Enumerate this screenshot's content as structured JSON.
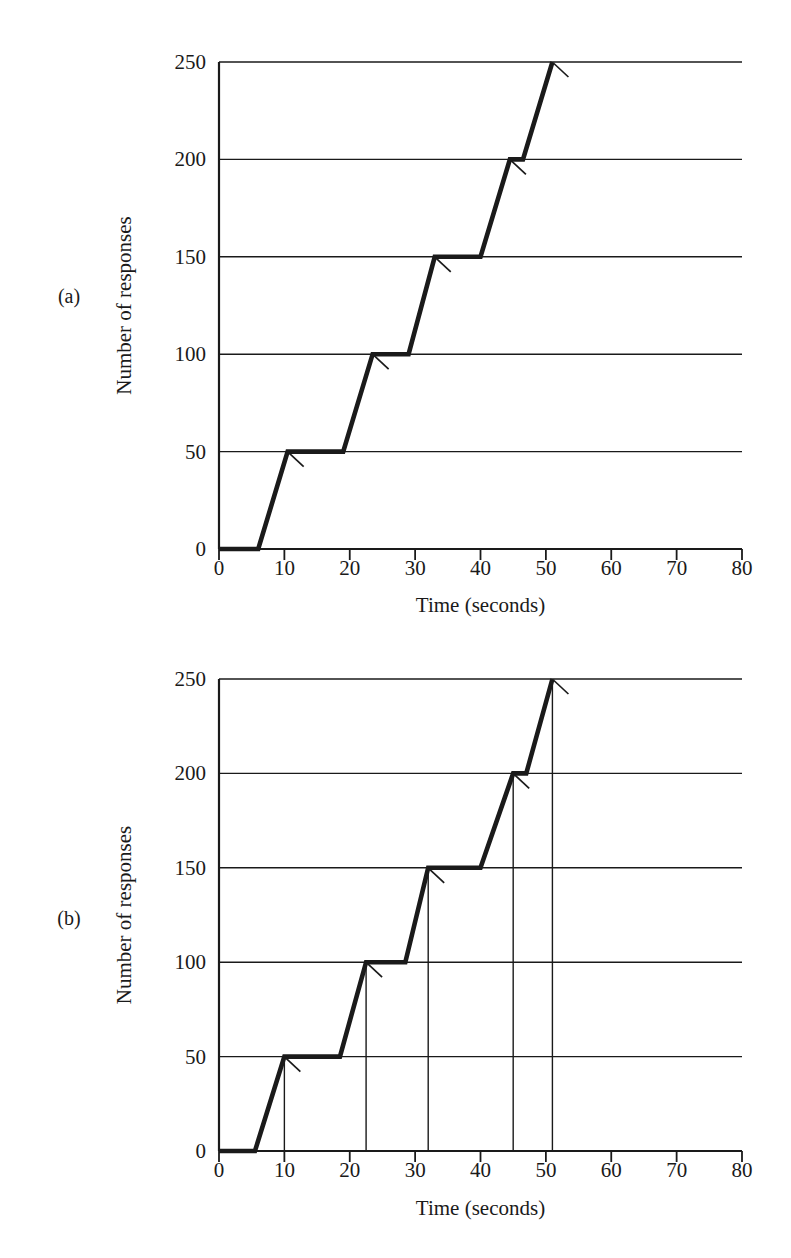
{
  "figure": {
    "background": "#ffffff",
    "ink": "#1a1a1a",
    "panels": [
      {
        "id": "a",
        "label": "(a)"
      },
      {
        "id": "b",
        "label": "(b)"
      }
    ]
  },
  "chart_data": [
    {
      "type": "line",
      "panel": "(a)",
      "title": "",
      "xlabel": "Time (seconds)",
      "ylabel": "Number of responses",
      "xlim": [
        0,
        80
      ],
      "ylim": [
        0,
        250
      ],
      "xticks": [
        0,
        10,
        20,
        30,
        40,
        50,
        60,
        70,
        80
      ],
      "xtick_labels": [
        "0",
        "10",
        "20",
        "30",
        "40",
        "50",
        "60",
        "70",
        "80"
      ],
      "yticks": [
        0,
        50,
        100,
        150,
        200,
        250
      ],
      "ytick_labels": [
        "0",
        "50",
        "100",
        "150",
        "200",
        "250"
      ],
      "grid": "horizontal",
      "legend": "none",
      "series": [
        {
          "name": "cumulative responses",
          "x": [
            0,
            6,
            10.5,
            19,
            23.5,
            29,
            33,
            40,
            44.5,
            46.5,
            51
          ],
          "y": [
            0,
            0,
            50,
            50,
            100,
            100,
            150,
            150,
            200,
            200,
            250
          ]
        }
      ],
      "reinforcement_marks": [
        {
          "x": 10.5,
          "y": 50
        },
        {
          "x": 23.5,
          "y": 100
        },
        {
          "x": 33,
          "y": 150
        },
        {
          "x": 44.5,
          "y": 200
        },
        {
          "x": 51,
          "y": 250
        }
      ],
      "droplines": []
    },
    {
      "type": "line",
      "panel": "(b)",
      "title": "",
      "xlabel": "Time (seconds)",
      "ylabel": "Number of responses",
      "xlim": [
        0,
        80
      ],
      "ylim": [
        0,
        250
      ],
      "xticks": [
        0,
        10,
        20,
        30,
        40,
        50,
        60,
        70,
        80
      ],
      "xtick_labels": [
        "0",
        "10",
        "20",
        "30",
        "40",
        "50",
        "60",
        "70",
        "80"
      ],
      "yticks": [
        0,
        50,
        100,
        150,
        200,
        250
      ],
      "ytick_labels": [
        "0",
        "50",
        "100",
        "150",
        "200",
        "250"
      ],
      "grid": "horizontal",
      "legend": "none",
      "series": [
        {
          "name": "cumulative responses",
          "x": [
            0,
            5.5,
            10,
            18.5,
            22.5,
            28.5,
            32,
            40,
            45,
            47,
            51
          ],
          "y": [
            0,
            0,
            50,
            50,
            100,
            100,
            150,
            150,
            200,
            200,
            250
          ]
        }
      ],
      "reinforcement_marks": [
        {
          "x": 10,
          "y": 50
        },
        {
          "x": 22.5,
          "y": 100
        },
        {
          "x": 32,
          "y": 150
        },
        {
          "x": 45,
          "y": 200
        },
        {
          "x": 51,
          "y": 250
        }
      ],
      "droplines": [
        {
          "x": 10,
          "y": 50
        },
        {
          "x": 22.5,
          "y": 100
        },
        {
          "x": 32,
          "y": 150
        },
        {
          "x": 45,
          "y": 200
        },
        {
          "x": 51,
          "y": 250
        }
      ]
    }
  ]
}
